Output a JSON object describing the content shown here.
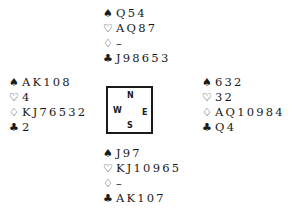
{
  "suits": {
    "spades": "♠",
    "hearts": "♡",
    "diamonds": "♢",
    "clubs": "♣"
  },
  "compass": {
    "north": "N",
    "west": "W",
    "east": "E",
    "south": "S"
  },
  "hands": {
    "north": {
      "spades": "Q54",
      "hearts": "AQ87",
      "diamonds": "–",
      "clubs": "J98653"
    },
    "west": {
      "spades": "AK108",
      "hearts": "4",
      "diamonds": "KJ76532",
      "clubs": "2"
    },
    "east": {
      "spades": "632",
      "hearts": "32",
      "diamonds": "AQ10984",
      "clubs": "Q4"
    },
    "south": {
      "spades": "J97",
      "hearts": "KJ10965",
      "diamonds": "–",
      "clubs": "AK107"
    }
  }
}
